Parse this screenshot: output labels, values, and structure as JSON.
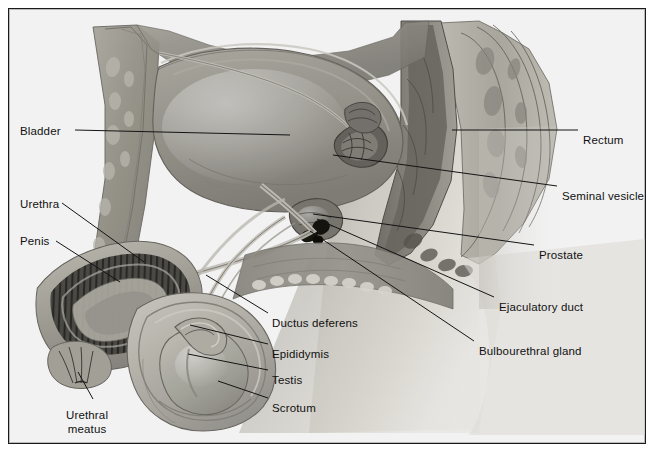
{
  "figure": {
    "border_color": "#1b1b1b",
    "label_color": "#111111",
    "leader_color": "#141414",
    "background": "#ffffff"
  },
  "labels": [
    {
      "id": "bladder",
      "text": "Bladder",
      "side": "left",
      "x": 20,
      "y": 125
    },
    {
      "id": "urethra",
      "text": "Urethra",
      "side": "left",
      "x": 20,
      "y": 198
    },
    {
      "id": "penis",
      "text": "Penis",
      "side": "left",
      "x": 20,
      "y": 235
    },
    {
      "id": "urethral-meatus",
      "text": "Urethral\nmeatus",
      "side": "left",
      "x": 66,
      "y": 408
    },
    {
      "id": "ductus-deferens",
      "text": "Ductus deferens",
      "side": "mid",
      "x": 272,
      "y": 317
    },
    {
      "id": "epididymis",
      "text": "Epididymis",
      "side": "mid",
      "x": 272,
      "y": 348
    },
    {
      "id": "testis",
      "text": "Testis",
      "side": "mid",
      "x": 272,
      "y": 374
    },
    {
      "id": "scrotum",
      "text": "Scrotum",
      "side": "mid",
      "x": 272,
      "y": 402
    },
    {
      "id": "rectum",
      "text": "Rectum",
      "side": "right",
      "x": 583,
      "y": 134
    },
    {
      "id": "seminal-vesicle",
      "text": "Seminal vesicle",
      "side": "right",
      "x": 562,
      "y": 190
    },
    {
      "id": "prostate",
      "text": "Prostate",
      "side": "right",
      "x": 539,
      "y": 249
    },
    {
      "id": "ejaculatory-duct",
      "text": "Ejaculatory duct",
      "side": "right",
      "x": 499,
      "y": 301
    },
    {
      "id": "bulbourethral-gland",
      "text": "Bulbourethral gland",
      "side": "right",
      "x": 479,
      "y": 345
    }
  ],
  "leaders": [
    {
      "id": "bladder",
      "x1": 75,
      "y1": 130,
      "x2": 290,
      "y2": 135
    },
    {
      "id": "urethra",
      "x1": 62,
      "y1": 203,
      "x2": 144,
      "y2": 262
    },
    {
      "id": "penis",
      "x1": 56,
      "y1": 241,
      "x2": 120,
      "y2": 282
    },
    {
      "id": "urethral-meatus",
      "x1": 93,
      "y1": 399,
      "x2": 78,
      "y2": 372
    },
    {
      "id": "ductus-deferens",
      "x1": 268,
      "y1": 313,
      "x2": 206,
      "y2": 275
    },
    {
      "id": "epididymis",
      "x1": 268,
      "y1": 344,
      "x2": 190,
      "y2": 325
    },
    {
      "id": "testis",
      "x1": 268,
      "y1": 370,
      "x2": 188,
      "y2": 354
    },
    {
      "id": "scrotum",
      "x1": 268,
      "y1": 398,
      "x2": 218,
      "y2": 381
    },
    {
      "id": "rectum",
      "x1": 578,
      "y1": 130,
      "x2": 452,
      "y2": 130
    },
    {
      "id": "seminal-vesicle",
      "x1": 557,
      "y1": 186,
      "x2": 333,
      "y2": 155
    },
    {
      "id": "prostate",
      "x1": 534,
      "y1": 245,
      "x2": 313,
      "y2": 214
    },
    {
      "id": "ejaculatory-duct",
      "x1": 494,
      "y1": 297,
      "x2": 317,
      "y2": 219
    },
    {
      "id": "bulbourethral-gland",
      "x1": 474,
      "y1": 341,
      "x2": 310,
      "y2": 231
    }
  ]
}
